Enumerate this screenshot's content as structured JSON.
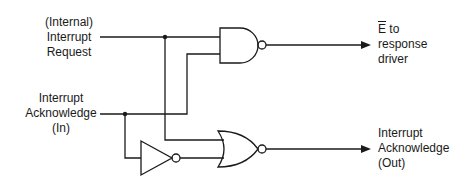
{
  "diagram": {
    "type": "logic-circuit",
    "inputs": {
      "interrupt_request": [
        "(Internal)",
        "Interrupt",
        "Request"
      ],
      "interrupt_ack_in": [
        "Interrupt",
        "Acknowledge",
        "(In)"
      ]
    },
    "outputs": {
      "enable_out": {
        "signal": "E",
        "rest": " to",
        "lines": [
          "response",
          "driver"
        ]
      },
      "interrupt_ack_out": [
        "Interrupt",
        "Acknowledge",
        "(Out)"
      ]
    },
    "gates": [
      {
        "type": "NAND",
        "inputs": [
          "Interrupt Request",
          "Interrupt Acknowledge (In)"
        ],
        "output": "E-bar to response driver"
      },
      {
        "type": "NOT",
        "inputs": [
          "Interrupt Acknowledge (In)"
        ],
        "output": "NOR input 2"
      },
      {
        "type": "NOR",
        "inputs": [
          "Interrupt Request",
          "NOT(Interrupt Acknowledge (In))"
        ],
        "output": "Interrupt Acknowledge (Out)"
      }
    ],
    "stroke_color": "#1a1a1a"
  }
}
